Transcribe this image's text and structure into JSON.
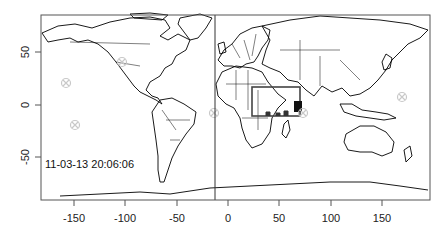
{
  "map": {
    "timestamp_label": "11-03-13 20:06:06",
    "x_axis": {
      "ticks": [
        -150,
        -100,
        -50,
        0,
        50,
        100,
        150
      ],
      "labels": [
        "-150",
        "-100",
        "-50",
        "0",
        "50",
        "100",
        "150"
      ],
      "range": [
        -182,
        197
      ]
    },
    "y_axis": {
      "ticks": [
        50,
        0,
        -50
      ],
      "labels": [
        "50",
        "0",
        "-50"
      ],
      "range": [
        -90,
        86
      ]
    },
    "vertical_line_lon": -13,
    "highlight_rect": {
      "lon_min": 23,
      "lon_max": 70,
      "lat_min": -10,
      "lat_max": 17
    },
    "markers": [
      {
        "lon": -158,
        "lat": 21,
        "symbol": "circle-x"
      },
      {
        "lon": -149,
        "lat": -19,
        "symbol": "circle-x"
      },
      {
        "lon": -103,
        "lat": 41,
        "symbol": "circle-x"
      },
      {
        "lon": -14,
        "lat": -8,
        "symbol": "circle-x"
      },
      {
        "lon": 73,
        "lat": -8,
        "symbol": "circle-x"
      },
      {
        "lon": 169,
        "lat": 8,
        "symbol": "circle-x"
      }
    ],
    "colors": {
      "outline": "#000000",
      "frame": "#555555",
      "marker": "#c8c8c8",
      "highlight": "#444444"
    }
  }
}
